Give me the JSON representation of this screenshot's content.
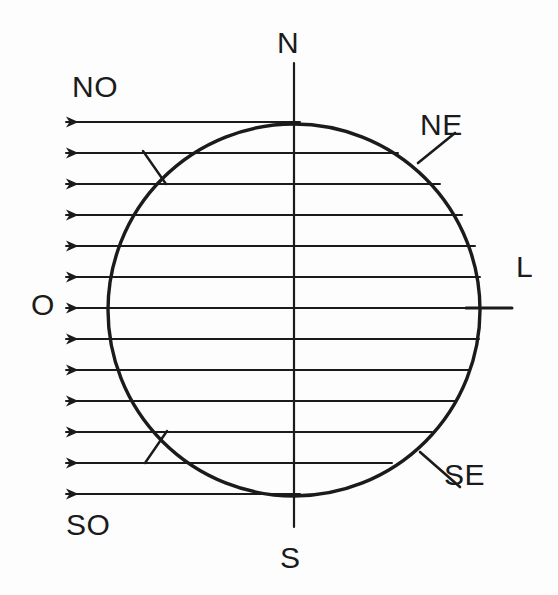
{
  "figure": {
    "background_color": "#fdfdfd",
    "ink_color": "#1b1b1b"
  },
  "labels": {
    "north": "N",
    "south": "S",
    "west": "O",
    "east": "L",
    "northwest": "NO",
    "northeast": "NE",
    "southeast": "SE",
    "southwest": "SO"
  },
  "chart_data": {
    "type": "diagram",
    "xlabel": "",
    "ylabel": "",
    "grid": false,
    "legend": "none",
    "xlim": [
      0,
      558
    ],
    "ylim": [
      0,
      595
    ],
    "circle": {
      "name": "sphere-outline",
      "cx": 294,
      "cy": 310,
      "r": 186,
      "stroke": "#1b1b1b",
      "stroke_width": 3.4,
      "fill": "none"
    },
    "axes": [
      {
        "name": "vertical-axis-north-south",
        "orientation": "vertical",
        "x1": 294,
        "y1": 63,
        "x2": 294,
        "y2": 527,
        "stroke_width": 2.2,
        "endpoint_labels": [
          "N",
          "S"
        ]
      },
      {
        "name": "horizontal-axis-east-stub",
        "orientation": "horizontal",
        "x1": 466,
        "y1": 308,
        "x2": 512,
        "y2": 308,
        "stroke_width": 3.0,
        "endpoint_labels": [
          "L"
        ]
      }
    ],
    "arrows": {
      "name": "zonal-flow-arrows",
      "count": 13,
      "direction": "west",
      "head_x": 66,
      "spacing_px": 31,
      "stroke_width": 2.0,
      "rows": [
        {
          "index": 1,
          "y": 122,
          "tail_x": 300
        },
        {
          "index": 2,
          "y": 153,
          "tail_x": 398
        },
        {
          "index": 3,
          "y": 184,
          "tail_x": 440
        },
        {
          "index": 4,
          "y": 215,
          "tail_x": 462
        },
        {
          "index": 5,
          "y": 246,
          "tail_x": 475
        },
        {
          "index": 6,
          "y": 277,
          "tail_x": 480
        },
        {
          "index": 7,
          "y": 308,
          "tail_x": 481
        },
        {
          "index": 8,
          "y": 339,
          "tail_x": 479
        },
        {
          "index": 9,
          "y": 370,
          "tail_x": 470
        },
        {
          "index": 10,
          "y": 401,
          "tail_x": 455
        },
        {
          "index": 11,
          "y": 432,
          "tail_x": 432
        },
        {
          "index": 12,
          "y": 463,
          "tail_x": 392
        },
        {
          "index": 13,
          "y": 494,
          "tail_x": 300
        }
      ]
    },
    "leader_lines": [
      {
        "name": "ne-leader",
        "for_label": "NE",
        "x1": 418,
        "y1": 163,
        "x2": 455,
        "y2": 133,
        "stroke_width": 2.6
      },
      {
        "name": "se-leader",
        "for_label": "SE",
        "x1": 420,
        "y1": 452,
        "x2": 460,
        "y2": 487,
        "stroke_width": 2.6
      },
      {
        "name": "no-tick",
        "for_label": "NO",
        "x1": 143,
        "y1": 151,
        "x2": 166,
        "y2": 184,
        "stroke_width": 2.4
      },
      {
        "name": "so-tick",
        "for_label": "SO",
        "x1": 145,
        "y1": 463,
        "x2": 167,
        "y2": 431,
        "stroke_width": 2.4
      }
    ],
    "label_positions": [
      {
        "text": "N",
        "x": 292,
        "y": 45,
        "anchor": "middle"
      },
      {
        "text": "S",
        "x": 292,
        "y": 560,
        "anchor": "middle"
      },
      {
        "text": "O",
        "x": 42,
        "y": 310,
        "anchor": "middle"
      },
      {
        "text": "L",
        "x": 523,
        "y": 272,
        "anchor": "middle"
      },
      {
        "text": "NO",
        "x": 100,
        "y": 92,
        "anchor": "middle"
      },
      {
        "text": "NE",
        "x": 446,
        "y": 130,
        "anchor": "middle"
      },
      {
        "text": "SE",
        "x": 470,
        "y": 480,
        "anchor": "middle"
      },
      {
        "text": "SO",
        "x": 94,
        "y": 530,
        "anchor": "middle"
      }
    ]
  }
}
